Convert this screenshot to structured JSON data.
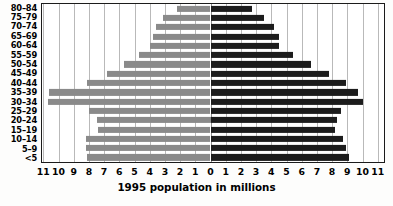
{
  "chart_data": {
    "type": "bar",
    "title": "",
    "xlabel": "1995 population in millions",
    "ylabel": "",
    "orientation": "horizontal",
    "layout": "population-pyramid",
    "grid": true,
    "legend": "none",
    "xlim": [
      -11.5,
      11.5
    ],
    "xticks": [
      11,
      10,
      9,
      8,
      7,
      6,
      5,
      4,
      3,
      2,
      1,
      0,
      1,
      2,
      3,
      4,
      5,
      6,
      7,
      8,
      9,
      10,
      11
    ],
    "xtick_values": [
      -11,
      -10,
      -9,
      -8,
      -7,
      -6,
      -5,
      -4,
      -3,
      -2,
      -1,
      0,
      1,
      2,
      3,
      4,
      5,
      6,
      7,
      8,
      9,
      10,
      11
    ],
    "categories": [
      "80–84",
      "75–79",
      "70–74",
      "65–69",
      "60–64",
      "55–59",
      "50–54",
      "45–49",
      "40–44",
      "35–39",
      "30–34",
      "25–29",
      "20–24",
      "15–19",
      "10–14",
      "5–9",
      "<5"
    ],
    "series": [
      {
        "name": "left",
        "side": "left",
        "color": "#8a8a8a",
        "values": [
          2.2,
          3.1,
          3.6,
          3.8,
          4.0,
          4.7,
          5.7,
          6.8,
          8.1,
          10.6,
          10.7,
          8.0,
          7.5,
          7.4,
          8.2,
          8.2,
          8.1
        ]
      },
      {
        "name": "right",
        "side": "right",
        "color": "#1c1c1c",
        "values": [
          2.7,
          3.5,
          4.2,
          4.5,
          4.5,
          5.4,
          6.6,
          7.8,
          8.9,
          9.7,
          10.0,
          8.6,
          8.3,
          8.2,
          8.7,
          8.9,
          9.1
        ]
      }
    ]
  },
  "axis": {
    "title": "1995 population in millions"
  }
}
